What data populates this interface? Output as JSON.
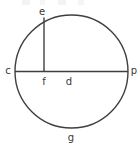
{
  "figure": {
    "type": "geometry-diagram",
    "shape": "circle",
    "background_color": "#ffffff",
    "stroke_color": "#3f3f3f",
    "label_color": "#3a3a3a",
    "circle": {
      "center_x": 71.5,
      "center_y": 71.5,
      "radius": 56.5
    },
    "segments": [
      {
        "name": "diameter-c-p",
        "from_label": "c",
        "to_label": "p",
        "x1": 15,
        "y1": 71.5,
        "x2": 128,
        "y2": 71.5
      },
      {
        "name": "radius-f-e",
        "from_label": "f",
        "to_label": "e",
        "x1": 44,
        "y1": 71.5,
        "x2": 44,
        "y2": 17.5
      }
    ],
    "labels": [
      {
        "id": "e",
        "text": "e",
        "x": 42,
        "y": 12,
        "anchor": "middle",
        "role": "point-on-circle-top"
      },
      {
        "id": "c",
        "text": "c",
        "x": 8,
        "y": 71,
        "anchor": "middle",
        "role": "point-on-circle-left"
      },
      {
        "id": "f",
        "text": "f",
        "x": 44,
        "y": 82,
        "anchor": "middle",
        "role": "point-center-foot"
      },
      {
        "id": "d",
        "text": "d",
        "x": 69,
        "y": 82,
        "anchor": "middle",
        "role": "segment-label-right-of-f"
      },
      {
        "id": "p",
        "text": "p",
        "x": 134,
        "y": 71,
        "anchor": "middle",
        "role": "point-on-circle-right"
      },
      {
        "id": "g",
        "text": "g",
        "x": 71,
        "y": 138,
        "anchor": "middle",
        "role": "point-on-circle-bottom"
      }
    ]
  }
}
